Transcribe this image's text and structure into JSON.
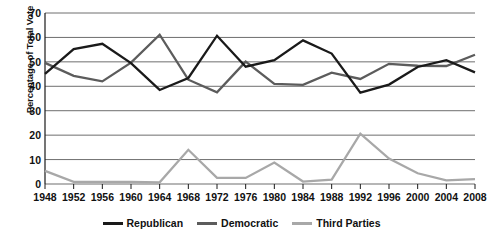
{
  "chart_data": {
    "type": "line",
    "title": "",
    "xlabel": "",
    "ylabel": "Percentage of Total Vote",
    "categories": [
      "1948",
      "1952",
      "1956",
      "1960",
      "1964",
      "1968",
      "1972",
      "1976",
      "1980",
      "1984",
      "1988",
      "1992",
      "1996",
      "2000",
      "2004",
      "2008"
    ],
    "ylim": [
      0,
      70
    ],
    "yticks": [
      0,
      10,
      20,
      30,
      40,
      50,
      60,
      70
    ],
    "grid": true,
    "legend_position": "bottom",
    "series": [
      {
        "name": "Republican",
        "color": "#1a1a1a",
        "values": [
          45.1,
          55.2,
          57.4,
          49.5,
          38.5,
          43.4,
          60.7,
          48.0,
          50.7,
          58.8,
          53.4,
          37.4,
          40.7,
          47.9,
          50.7,
          45.7
        ]
      },
      {
        "name": "Democratic",
        "color": "#5c5c5c",
        "values": [
          49.6,
          44.3,
          42.0,
          49.7,
          61.1,
          42.7,
          37.5,
          50.1,
          41.0,
          40.6,
          45.6,
          43.0,
          49.2,
          48.4,
          48.3,
          52.9
        ]
      },
      {
        "name": "Third Parties",
        "color": "#a8a8a8",
        "values": [
          5.4,
          0.9,
          0.9,
          0.9,
          0.7,
          14.0,
          2.5,
          2.5,
          8.8,
          1.0,
          1.8,
          20.6,
          10.4,
          4.4,
          1.5,
          2.0
        ]
      }
    ]
  },
  "legend": {
    "items": [
      {
        "label": "Republican",
        "color": "#1a1a1a",
        "icon": "line-swatch-icon"
      },
      {
        "label": "Democratic",
        "color": "#5c5c5c",
        "icon": "line-swatch-icon"
      },
      {
        "label": "Third Parties",
        "color": "#a8a8a8",
        "icon": "line-swatch-icon"
      }
    ]
  },
  "axes": {
    "y_title": "Percentage of Total Vote",
    "y_tick_labels": [
      "70",
      "60",
      "50",
      "40",
      "30",
      "20",
      "10",
      "0"
    ],
    "x_tick_labels": [
      "1948",
      "1952",
      "1956",
      "1960",
      "1964",
      "1968",
      "1972",
      "1976",
      "1980",
      "1984",
      "1988",
      "1992",
      "1996",
      "2000",
      "2004",
      "2008"
    ]
  },
  "colors": {
    "background": "#ffffff",
    "gridline": "#6e6e6e",
    "axis": "#1a1a1a",
    "republican": "#1a1a1a",
    "democratic": "#5c5c5c",
    "third_parties": "#a8a8a8"
  }
}
